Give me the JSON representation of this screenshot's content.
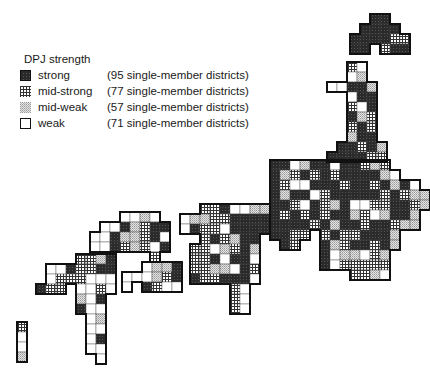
{
  "legend": {
    "title": "DPJ strength",
    "items": [
      {
        "key": "strong",
        "label": "strong",
        "detail": "(95 single-member districts)"
      },
      {
        "key": "midstrong",
        "label": "mid-strong",
        "detail": "(77 single-member districts)"
      },
      {
        "key": "midweak",
        "label": "mid-weak",
        "detail": "(57 single-member districts)"
      },
      {
        "key": "weak",
        "label": "weak",
        "detail": "(71 single-member districts)"
      }
    ]
  },
  "colors": {
    "strong": "#2a2a2a",
    "midstrong_line": "#333333",
    "midweak_dot": "#9a9a9a",
    "weak": "#ffffff",
    "outline": "#111111"
  },
  "map": {
    "cell": 10,
    "regions": [
      {
        "name": "hokkaido",
        "x": 350,
        "y": 14,
        "cells": [
          "..SS..",
          ".SSSS.",
          "SSSSMM",
          "SS.MSS"
        ]
      },
      {
        "name": "tohoku",
        "x": 327,
        "y": 62,
        "cells": [
          "..MW..",
          "..WD..",
          "WWSSD.",
          "..WSS.",
          "..MWS.",
          "..SDM.",
          "..MSM.",
          "..DSS.",
          ".SSMSD",
          "SSSSMM"
        ]
      },
      {
        "name": "kanto-chubu",
        "x": 270,
        "y": 160,
        "cells": [
          "SSWDSSWSSMDM....",
          "SDMSMSMSSSSDW...",
          "SMWWSSSMSSMSDSW.",
          "SDSSWMSSSSSMSMDD",
          "SSMWSMDSWWMMSSMD",
          "SMSMSMSSDMWDSSD.",
          "SSSSMSDSSMSSMDD.",
          "SSMM.MSMMSSSD...",
          ".SM..SDMSSMSD...",
          ".....SWDDWMD....",
          ".....SWMMMMM....",
          "........MMDW...."
        ]
      },
      {
        "name": "kinki",
        "x": 180,
        "y": 204,
        "cells": [
          "..MMSWWDD",
          "WDDMMSSSS",
          "WSMMWSSSS",
          "..MSMDSS.",
          ".MMWDMSD.",
          ".MMSWSSW.",
          ".MMDDWSM.",
          ".SMMSSSW.",
          ".....MW..",
          ".....MW..",
          ".....MW.."
        ]
      },
      {
        "name": "chugoku",
        "x": 90,
        "y": 212,
        "cells": [
          "...WWDW....",
          ".WWSDMSS...",
          "WWSDDMSW...",
          "WWSMDMWS...",
          "......M...."
        ]
      },
      {
        "name": "shikoku",
        "x": 122,
        "y": 262,
        "cells": [
          "..WDDS",
          "WWWDMS",
          "W.SMWW"
        ]
      },
      {
        "name": "kyushu",
        "x": 36,
        "y": 254,
        "cells": [
          "....MMDS",
          ".WWSMMSS",
          ".WMMMWWW",
          "SMM.WWMW",
          "....DWS.",
          "....SWW.",
          ".....WD.",
          ".....WW.",
          ".....WS.",
          ".....WW.",
          "......W."
        ]
      },
      {
        "name": "okinawa",
        "x": 17,
        "y": 322,
        "cells": [
          "M",
          "W",
          "W",
          "D"
        ]
      }
    ]
  }
}
